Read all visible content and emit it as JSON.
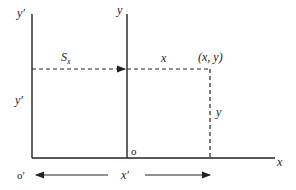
{
  "diagram": {
    "labels": {
      "y_prime_top": "y′",
      "y_top": "y",
      "shift_main": "S",
      "shift_sub": "x",
      "x_segment": "x",
      "point": "(x, y)",
      "y_prime_side": "y′",
      "y_side": "y",
      "origin": "o",
      "x_axis": "x",
      "origin_prime": "o′",
      "x_prime": "x′"
    },
    "colors": {
      "stroke": "#222222",
      "background": "#ffffff"
    }
  }
}
